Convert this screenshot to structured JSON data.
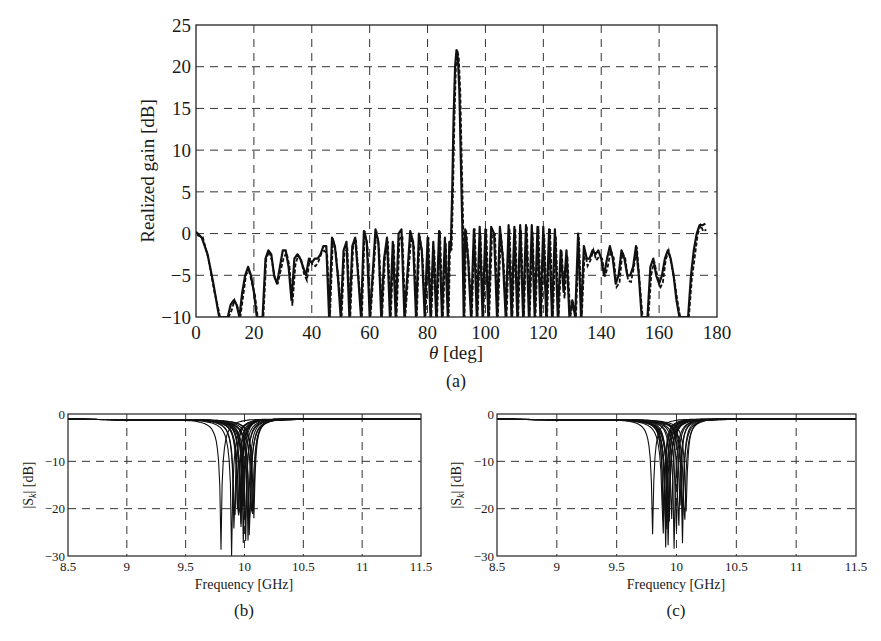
{
  "figure": {
    "panels": [
      "(a)",
      "(b)",
      "(c)"
    ]
  },
  "chart_data": [
    {
      "id": "a",
      "type": "line",
      "caption": "(a)",
      "title": "",
      "xlabel": "θ [deg]",
      "ylabel": "Realized gain [dB]",
      "xlim": [
        0,
        180
      ],
      "ylim": [
        -10,
        25
      ],
      "xticks": [
        0,
        20,
        40,
        60,
        80,
        100,
        120,
        140,
        160,
        180
      ],
      "yticks": [
        -10,
        -5,
        0,
        5,
        10,
        15,
        20,
        25
      ],
      "grid": true,
      "grid_style": "dashed",
      "legend": null,
      "series": [
        {
          "name": "solid",
          "style": "solid",
          "x": [
            0,
            2,
            4,
            6,
            7.5,
            8,
            11,
            12,
            13,
            14,
            15,
            16,
            17,
            18,
            19,
            20,
            21,
            22,
            23,
            24,
            25,
            26,
            27,
            28,
            29,
            30,
            31,
            32,
            33,
            34,
            35,
            36,
            37,
            38,
            39,
            40,
            41,
            42,
            43,
            44,
            45,
            46,
            47,
            48,
            49,
            50,
            51,
            52,
            53,
            54,
            55,
            56,
            57,
            58,
            59,
            60,
            61,
            62,
            63,
            64,
            65,
            66,
            67,
            68,
            69,
            70,
            71,
            72,
            73,
            74,
            75,
            76,
            77,
            78,
            79,
            80,
            81,
            82,
            83,
            84,
            85,
            86,
            87,
            87.5,
            88,
            88.5,
            89,
            89.5,
            90,
            90.5,
            91,
            91.5,
            92,
            92.5,
            93,
            94,
            95,
            96,
            97,
            98,
            99,
            100,
            101,
            102,
            103,
            104,
            105,
            106,
            107,
            108,
            109,
            110,
            111,
            112,
            113,
            114,
            115,
            116,
            117,
            118,
            119,
            120,
            121,
            122,
            123,
            124,
            125,
            126,
            127,
            128,
            129,
            130,
            131,
            132,
            133,
            134,
            135,
            136,
            137,
            138,
            139,
            140,
            141,
            142,
            143,
            144,
            145,
            146,
            147,
            148,
            149,
            150,
            151,
            152,
            153,
            154,
            155,
            156,
            157,
            158,
            159,
            160,
            161,
            162,
            163,
            164,
            165,
            166,
            167,
            168,
            169,
            170,
            171,
            172,
            173,
            174,
            175,
            176,
            177,
            178,
            179,
            180
          ],
          "y": [
            0.2,
            -0.5,
            -2.5,
            -6,
            -9,
            -10,
            -10,
            -8.5,
            -8,
            -8.5,
            -10,
            -7,
            -5,
            -4,
            -5,
            -7,
            -10,
            -10,
            -10,
            -3,
            -2,
            -2.5,
            -5,
            -6,
            -4,
            -2,
            -2,
            -4,
            -8,
            -3,
            -2.5,
            -3,
            -4,
            -5,
            -3,
            -3.5,
            -3,
            -3,
            -2.5,
            -1.5,
            -1.5,
            -10,
            -0.5,
            -1.5,
            -5,
            -10,
            -2,
            -1,
            -10,
            -1.5,
            -0.5,
            -5,
            -10,
            0.3,
            -1,
            -10,
            -5,
            0.5,
            -1,
            -10,
            -3,
            -0.5,
            -10,
            -1,
            -10,
            0,
            0.5,
            -10,
            -5,
            0.3,
            -1,
            -10,
            0,
            -2,
            -10,
            -0.5,
            -10,
            -1,
            -10,
            0.3,
            -10,
            -0.5,
            -10,
            -1,
            -2,
            5,
            14,
            20,
            22,
            21,
            17,
            9,
            1,
            -10,
            0.5,
            -3,
            -10,
            0.5,
            -10,
            0.8,
            -10,
            0.5,
            -10,
            0.8,
            0,
            -10,
            0.8,
            -3,
            -10,
            1,
            -10,
            0.8,
            -10,
            1,
            -10,
            1,
            -10,
            1,
            -10,
            0.8,
            -10,
            0.8,
            -10,
            0.5,
            -10,
            0.5,
            -10,
            -2,
            -7,
            -2,
            -10,
            -8,
            -10,
            0,
            -10,
            -1.5,
            -3,
            -3,
            -2,
            -2.5,
            -2,
            -3,
            -5,
            -3,
            -1.5,
            -3,
            -6,
            -5,
            -2,
            -3,
            -5,
            -5,
            -4,
            -1.5,
            -5,
            -10,
            -10,
            -10,
            -4,
            -3,
            -5,
            -6,
            -5,
            -3,
            -2,
            -3,
            -5,
            -8,
            -10,
            -10,
            -10,
            -10,
            -5,
            -2,
            0,
            1,
            1,
            1.2
          ]
        },
        {
          "name": "dashed",
          "style": "dashed",
          "note": "Second near-overlapping curve (dashed), visible mainly in sidelobe region"
        }
      ],
      "peak": {
        "x": 90,
        "y": 22
      }
    },
    {
      "id": "b",
      "type": "line",
      "caption": "(b)",
      "xlabel": "Frequency [GHz]",
      "ylabel": "|S_k| [dB]",
      "xlim": [
        8.5,
        11.5
      ],
      "ylim": [
        -30,
        0
      ],
      "xticks": [
        8.5,
        9,
        9.5,
        10,
        10.5,
        11,
        11.5
      ],
      "xtick_labels": [
        "8.5",
        "9",
        "9.5",
        "10",
        "10.5",
        "11",
        "11.5"
      ],
      "yticks": [
        -30,
        -20,
        -10,
        0
      ],
      "ytick_labels": [
        "−30",
        "−20",
        "−10",
        "0"
      ],
      "grid": true,
      "grid_style": "dashed",
      "legend": null,
      "series_count": 20,
      "resonance_range_ghz": [
        9.8,
        10.1
      ],
      "series_summary": [
        {
          "name": "S_k (family)",
          "min_freq_ghz": 9.8,
          "min_db": -30,
          "db_at_8_5": -1,
          "db_at_9": -2.5,
          "db_at_9_5": -6,
          "db_at_10_5": -8,
          "db_at_11": -4,
          "db_at_11_5": -2
        }
      ]
    },
    {
      "id": "c",
      "type": "line",
      "caption": "(c)",
      "xlabel": "Frequency [GHz]",
      "ylabel": "|S_k| [dB]",
      "xlim": [
        8.5,
        11.5
      ],
      "ylim": [
        -30,
        0
      ],
      "xticks": [
        8.5,
        9,
        9.5,
        10,
        10.5,
        11,
        11.5
      ],
      "xtick_labels": [
        "8.5",
        "9",
        "9.5",
        "10",
        "10.5",
        "11",
        "11.5"
      ],
      "yticks": [
        -30,
        -20,
        -10,
        0
      ],
      "ytick_labels": [
        "−30",
        "−20",
        "−10",
        "0"
      ],
      "grid": true,
      "grid_style": "dashed",
      "legend": null,
      "series_count": 20,
      "resonance_range_ghz": [
        9.8,
        10.1
      ],
      "series_summary": [
        {
          "name": "S_k (family)",
          "min_freq_ghz": 9.8,
          "min_db": -30,
          "db_at_8_5": -1,
          "db_at_9": -2.5,
          "db_at_9_5": -6,
          "db_at_10_5": -7,
          "db_at_11": -3.5,
          "db_at_11_5": -2
        }
      ]
    }
  ],
  "labels": {
    "a_xlabel_sym": "θ",
    "a_xlabel_unit": " [deg]",
    "a_ylabel": "Realized gain [dB]",
    "a_caption": "(a)",
    "b_xlabel": "Frequency [GHz]",
    "b_caption": "(b)",
    "c_xlabel": "Frequency [GHz]",
    "c_caption": "(c)",
    "s_ylabel_pre": "|S",
    "s_ylabel_sub": "k",
    "s_ylabel_post": "| [dB]"
  }
}
